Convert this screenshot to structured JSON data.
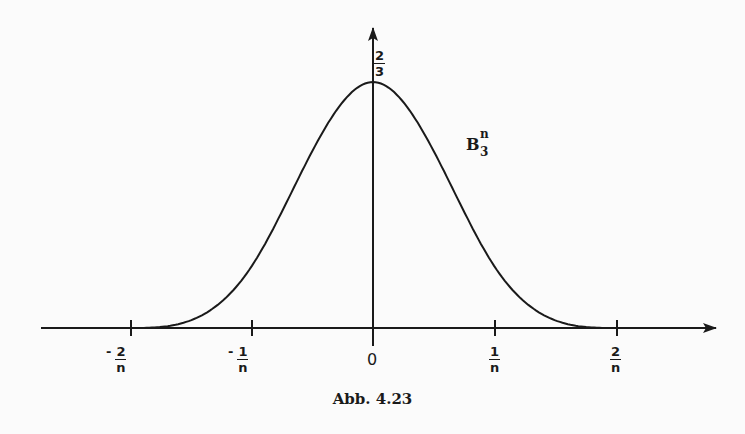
{
  "figure": {
    "caption": "Abb. 4.23",
    "curve_label": {
      "base": "B",
      "sup": "n",
      "sub": "3"
    },
    "y_tick": {
      "num": "2",
      "den": "3"
    },
    "x_ticks": [
      {
        "sign": "-",
        "num": "2",
        "den": "n"
      },
      {
        "sign": "-",
        "num": "1",
        "den": "n"
      },
      {
        "sign": "",
        "num": "0",
        "den": ""
      },
      {
        "sign": "",
        "num": "1",
        "den": "n"
      },
      {
        "sign": "",
        "num": "2",
        "den": "n"
      }
    ]
  },
  "chart_data": {
    "type": "line",
    "title": "Abb. 4.23",
    "series": [
      {
        "name": "B_3^n",
        "description": "cubic B-spline, support [-2/n, 2/n], peak 2/3 at 0"
      }
    ],
    "x": [
      -2,
      -1.5,
      -1,
      -0.5,
      0,
      0.5,
      1,
      1.5,
      2
    ],
    "values": [
      0,
      0.0208,
      0.1667,
      0.4792,
      0.6667,
      0.4792,
      0.1667,
      0.0208,
      0
    ],
    "xlabel": "",
    "ylabel": "",
    "x_tick_labels": [
      "-2/n",
      "-1/n",
      "0",
      "1/n",
      "2/n"
    ],
    "y_tick_labels": [
      "2/3"
    ],
    "grid": false
  }
}
